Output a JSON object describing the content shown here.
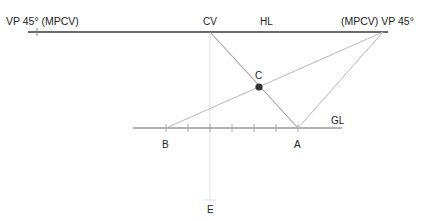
{
  "diagram": {
    "labels": {
      "vp_left": "VP 45° (MPCV)",
      "vp_right": "(MPCV) VP 45°",
      "cv": "CV",
      "hl": "HL",
      "c": "C",
      "gl": "GL",
      "b": "B",
      "a": "A",
      "e": "E"
    },
    "colors": {
      "horizon_line": "#333333",
      "construction_line": "#b5b5b5",
      "ground_line": "#9a9a9a",
      "center_line": "#e0e0e0",
      "point_c": "#333333",
      "text": "#222222"
    },
    "points": {
      "vp_left": [
        37,
        32
      ],
      "cv": [
        210,
        32
      ],
      "vp_right": [
        383,
        32
      ],
      "c": [
        259,
        87
      ],
      "b": [
        166,
        128
      ],
      "a": [
        298,
        128
      ],
      "e": [
        210,
        200
      ]
    },
    "ground_ticks": [
      166,
      188,
      210,
      232,
      254,
      276,
      298
    ]
  }
}
